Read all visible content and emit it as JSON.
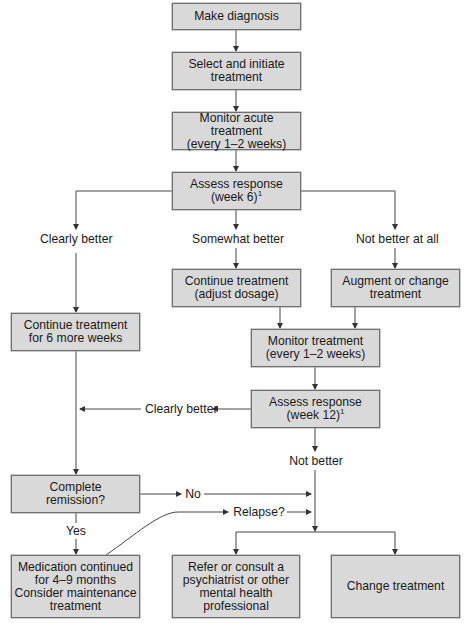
{
  "diagram": {
    "type": "flowchart",
    "colors": {
      "box_fill": "#d9d9d9",
      "box_border": "#6f6f6f",
      "line": "#333333",
      "background": "#ffffff"
    },
    "nodes": [
      {
        "id": "make_diagnosis",
        "text": "Make diagnosis"
      },
      {
        "id": "select_initiate",
        "text": "Select and initiate\ntreatment"
      },
      {
        "id": "monitor_acute",
        "text": "Monitor acute treatment\n(every 1–2 weeks)"
      },
      {
        "id": "assess_week6",
        "text": "Assess response\n(week 6)",
        "footnote": "1"
      },
      {
        "id": "continue_adjust",
        "text": "Continue treatment\n(adjust dosage)"
      },
      {
        "id": "augment_change",
        "text": "Augment or change\ntreatment"
      },
      {
        "id": "continue_6_weeks",
        "text": "Continue treatment\nfor 6 more weeks"
      },
      {
        "id": "monitor_treatment",
        "text": "Monitor treatment\n(every 1–2 weeks)"
      },
      {
        "id": "assess_week12",
        "text": "Assess response\n(week 12)",
        "footnote": "1"
      },
      {
        "id": "complete_remission",
        "text": "Complete\nremission?"
      },
      {
        "id": "medication_continued",
        "text": "Medication continued\nfor 4–9 months\nConsider maintenance\ntreatment"
      },
      {
        "id": "refer_consult",
        "text": "Refer or consult a\npsychiatrist or other\nmental health\nprofessional"
      },
      {
        "id": "change_treatment",
        "text": "Change treatment"
      }
    ],
    "edge_labels": {
      "clearly_better": "Clearly better",
      "somewhat_better": "Somewhat better",
      "not_better_at_all": "Not better at all",
      "clearly_better_wk12": "Clearly better",
      "not_better": "Not better",
      "no": "No",
      "yes": "Yes",
      "relapse": "Relapse?"
    },
    "edges": [
      [
        "make_diagnosis",
        "select_initiate"
      ],
      [
        "select_initiate",
        "monitor_acute"
      ],
      [
        "monitor_acute",
        "assess_week6"
      ],
      [
        "assess_week6",
        "continue_6_weeks",
        "Clearly better"
      ],
      [
        "assess_week6",
        "continue_adjust",
        "Somewhat better"
      ],
      [
        "assess_week6",
        "augment_change",
        "Not better at all"
      ],
      [
        "continue_adjust",
        "monitor_treatment"
      ],
      [
        "augment_change",
        "monitor_treatment"
      ],
      [
        "monitor_treatment",
        "assess_week12"
      ],
      [
        "assess_week12",
        "continue_6_weeks_line",
        "Clearly better"
      ],
      [
        "assess_week12",
        "refer_or_change",
        "Not better"
      ],
      [
        "continue_6_weeks",
        "complete_remission"
      ],
      [
        "complete_remission",
        "refer_or_change",
        "No"
      ],
      [
        "complete_remission",
        "medication_continued",
        "Yes"
      ],
      [
        "medication_continued",
        "refer_or_change",
        "Relapse?"
      ]
    ]
  }
}
